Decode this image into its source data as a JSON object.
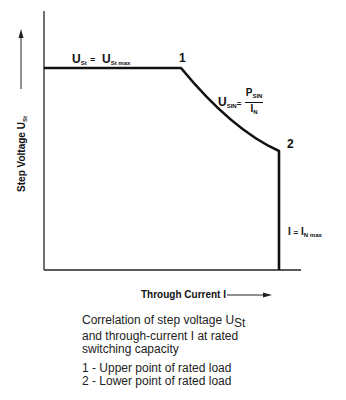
{
  "diagram": {
    "y_axis_label": {
      "text": "Step Voltage U",
      "subscript": "St"
    },
    "x_axis_label": "Through Current I",
    "points": [
      {
        "id": "1",
        "label": "1"
      },
      {
        "id": "2",
        "label": "2"
      }
    ],
    "annotations": {
      "flat_segment": {
        "lhs": "U",
        "lhs_sub": "St",
        "eq": "=",
        "rhs": "U",
        "rhs_sub": "St max"
      },
      "curve_segment": {
        "lhs": "U",
        "lhs_sub": "SIN",
        "eq": "=",
        "num": "P",
        "num_sub": "SIN",
        "den": "I",
        "den_sub": "N"
      },
      "vertical_segment": {
        "lhs": "I",
        "eq": "=",
        "rhs": "I",
        "rhs_sub": "N max"
      }
    }
  },
  "caption": {
    "line1_prefix": "Correlation of step voltage U",
    "line1_sub": "St",
    "line2": "and through-current I at rated",
    "line3": "switching capacity"
  },
  "legend": [
    "1 - Upper point of rated load",
    "2 - Lower point of rated load"
  ]
}
